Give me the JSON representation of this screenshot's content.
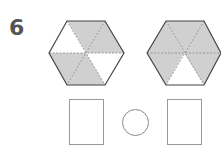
{
  "question": {
    "number": "6",
    "colors": {
      "shaded": "#d0d0d0",
      "unshaded": "#ffffff",
      "outline": "#444444",
      "divider": "#888888"
    },
    "hexagons": [
      {
        "id": "left",
        "sections": 6,
        "shaded_sections": 4,
        "fraction": "4/6",
        "shading": [
          "shaded",
          "shaded",
          "white",
          "shaded",
          "shaded",
          "white"
        ]
      },
      {
        "id": "right",
        "sections": 6,
        "shaded_sections": 5,
        "fraction": "5/6",
        "shading": [
          "shaded",
          "shaded",
          "shaded",
          "shaded",
          "white",
          "shaded"
        ]
      }
    ],
    "answer_boxes": [
      {
        "id": "left-fraction-box",
        "value": ""
      },
      {
        "id": "right-fraction-box",
        "value": ""
      }
    ],
    "comparison_circle": {
      "value": ""
    }
  }
}
